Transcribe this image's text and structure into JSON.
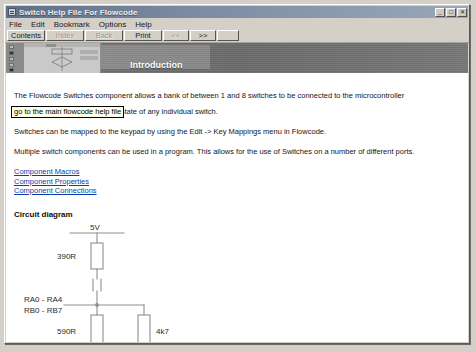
{
  "window": {
    "title": "Switch Help File For Flowcode",
    "icon": "help-book-icon",
    "buttons": {
      "minimize": "_",
      "maximize": "□",
      "close": "✕"
    }
  },
  "menubar": {
    "items": [
      {
        "label": "File"
      },
      {
        "label": "Edit"
      },
      {
        "label": "Bookmark"
      },
      {
        "label": "Options"
      },
      {
        "label": "Help"
      }
    ]
  },
  "toolbar": {
    "buttons": [
      {
        "label": "Contents",
        "disabled": false
      },
      {
        "label": "Index",
        "disabled": true
      },
      {
        "label": "Back",
        "disabled": true
      },
      {
        "label": "Print",
        "disabled": false
      },
      {
        "label": "<<",
        "disabled": true
      },
      {
        "label": ">>",
        "disabled": false
      }
    ]
  },
  "banner": {
    "title": "Introduction",
    "thumbnail_alt": "flowchart-thumbnail"
  },
  "tooltip": {
    "text": "go to the main flowcode help file"
  },
  "content": {
    "paragraphs": [
      "The Flowcode Switches component allows a bank of between 1 and 8 switches to be connected to the microcontroller",
      "A macro is available to read the state of any individual switch.",
      "Switches can be mapped to the keypad by using the Edit -> Key Mappings menu in Flowcode.",
      "Multiple switch components can be used in a program. This allows for the use of Switches on a number of different ports."
    ],
    "links": [
      {
        "label": "Component Macros"
      },
      {
        "label": "Component Properties"
      },
      {
        "label": "Component Connections"
      }
    ],
    "section_title": "Circuit diagram",
    "circuit": {
      "supply_label": "5V",
      "r_top_label": "390R",
      "r_mid_label": "590R",
      "r_right_label": "4k7",
      "port_label_1": "RA0 - RA4",
      "port_label_2": "RB0 - RB7",
      "symbols": [
        "switch",
        "led",
        "ground"
      ]
    }
  },
  "colors": {
    "title_bar": "#6f7f96",
    "face": "#d4d0c8",
    "banner": "#6e6e6e",
    "link": "#0b3fa8",
    "tooltip_bg": "#ffffe8",
    "wire": "#8a8a8a"
  }
}
